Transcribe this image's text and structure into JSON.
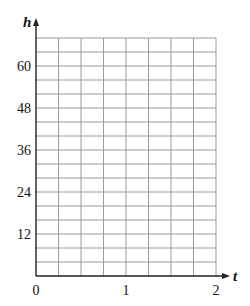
{
  "chart_data": {
    "type": "line",
    "title": "",
    "xlabel": "t",
    "ylabel": "h",
    "xlim": [
      0,
      2
    ],
    "ylim": [
      0,
      68
    ],
    "x_ticks": [
      0,
      1,
      2
    ],
    "x_tick_labels": [
      "0",
      "1",
      "2"
    ],
    "y_ticks": [
      12,
      24,
      36,
      48,
      60
    ],
    "y_tick_labels": [
      "12",
      "24",
      "36",
      "48",
      "60"
    ],
    "x_grid_step": 0.25,
    "y_grid_step": 4,
    "grid": true,
    "series": []
  },
  "colors": {
    "grid": "#9a9a9a",
    "axis": "#222222"
  }
}
